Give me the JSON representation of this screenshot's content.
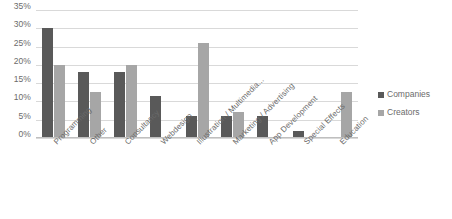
{
  "chart_data": {
    "type": "bar",
    "title": "",
    "xlabel": "",
    "ylabel": "",
    "ylim": [
      0,
      35
    ],
    "ytick_labels": [
      "35%",
      "30%",
      "25%",
      "20%",
      "15%",
      "10%",
      "5%",
      "0%"
    ],
    "ytick_values": [
      35,
      30,
      25,
      20,
      15,
      10,
      5,
      0
    ],
    "grid": true,
    "legend_position": "right",
    "categories": [
      "Programming",
      "Other",
      "Consultancy",
      "Webdesign",
      "Illustration / Multimedia...",
      "Marketing / Advertising",
      "App Development",
      "Special Effects",
      "Education"
    ],
    "series": [
      {
        "name": "Companies",
        "color": "#595959",
        "values": [
          30,
          18,
          18,
          11.5,
          6,
          6,
          6,
          2,
          0
        ]
      },
      {
        "name": "Creators",
        "color": "#a6a6a6",
        "values": [
          20,
          12.5,
          20,
          0,
          26,
          7,
          0,
          0,
          12.5
        ]
      }
    ]
  },
  "legend": {
    "items": [
      {
        "label": "Companies",
        "color": "#595959"
      },
      {
        "label": "Creators",
        "color": "#a6a6a6"
      }
    ]
  }
}
